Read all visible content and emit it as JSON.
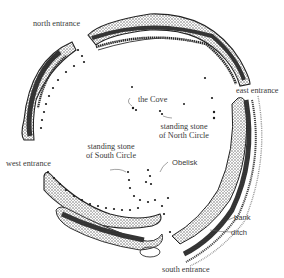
{
  "diagram": {
    "type": "henge-site-plan",
    "labels": {
      "north_entrance": "north entrance",
      "east_entrance": "east entrance",
      "west_entrance": "west entrance",
      "south_entrance": "south entrance",
      "the_cove": "the Cove",
      "standing_stone_north_line1": "standing stone",
      "standing_stone_north_line2": "of North Circle",
      "standing_stone_south_line1": "standing stone",
      "standing_stone_south_line2": "of South Circle",
      "obelisk": "Obelisk",
      "bank": "bank",
      "ditch": "ditch"
    },
    "colors": {
      "ink": "#1a1a1a",
      "stipple": "#5a5a5a",
      "text": "#3a3a3a",
      "background": "#ffffff"
    }
  }
}
